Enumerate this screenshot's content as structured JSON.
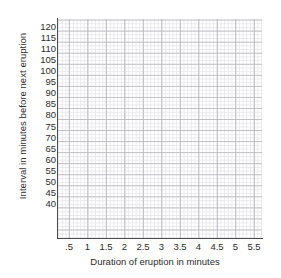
{
  "chart_data": {
    "type": "scatter",
    "title": "",
    "xlabel": "Duration of eruption in minutes",
    "ylabel": "Interval in minutes before next eruption",
    "grid": true,
    "legend": null,
    "series": [],
    "x": [],
    "values": [],
    "xlim": [
      0,
      5.8
    ],
    "ylim": [
      23,
      123
    ],
    "x_ticks": [
      {
        "label": ".5",
        "value": 0.5
      },
      {
        "label": "1",
        "value": 1
      },
      {
        "label": "1.5",
        "value": 1.5
      },
      {
        "label": "2",
        "value": 2
      },
      {
        "label": "2.5",
        "value": 2.5
      },
      {
        "label": "3",
        "value": 3
      },
      {
        "label": "3.5",
        "value": 3.5
      },
      {
        "label": "4",
        "value": 4
      },
      {
        "label": "4.5",
        "value": 4.5
      },
      {
        "label": "5",
        "value": 5
      },
      {
        "label": "5.5",
        "value": 5.5
      }
    ],
    "y_ticks": [
      {
        "label": "120",
        "value": 120
      },
      {
        "label": "115",
        "value": 115
      },
      {
        "label": "110",
        "value": 110
      },
      {
        "label": "105",
        "value": 105
      },
      {
        "label": "100",
        "value": 100
      },
      {
        "label": "95",
        "value": 95
      },
      {
        "label": "90",
        "value": 90
      },
      {
        "label": "85",
        "value": 85
      },
      {
        "label": "80",
        "value": 80
      },
      {
        "label": "75",
        "value": 75
      },
      {
        "label": "70",
        "value": 70
      },
      {
        "label": "65",
        "value": 65
      },
      {
        "label": "60",
        "value": 60
      },
      {
        "label": "55",
        "value": 55
      },
      {
        "label": "50",
        "value": 50
      },
      {
        "label": "45",
        "value": 45
      },
      {
        "label": "40",
        "value": 40
      }
    ],
    "colors": {
      "background": "#ffffff",
      "axis": "#4a4a4a",
      "grid_major": "#bdbdc2",
      "grid_minor": "#e9e9ec",
      "text": "#2b2b2b"
    }
  }
}
